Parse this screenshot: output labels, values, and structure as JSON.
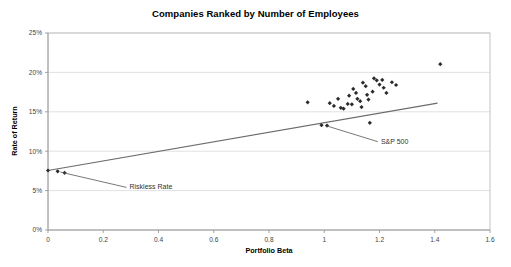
{
  "chart_data": {
    "type": "scatter",
    "title": "Companies Ranked by Number of Employees",
    "xlabel": "Portfolio Beta",
    "ylabel": "Rate of Return",
    "xlim": [
      0,
      1.6
    ],
    "ylim": [
      0,
      0.25
    ],
    "xticks": [
      0,
      0.2,
      0.4,
      0.6,
      0.8,
      1,
      1.2,
      1.4,
      1.6
    ],
    "xticklabels": [
      "0",
      "0.2",
      "0.4",
      "0.6",
      "0.8",
      "1",
      "1.2",
      "1.4",
      "1.6"
    ],
    "yticks": [
      0,
      0.05,
      0.1,
      0.15,
      0.2,
      0.25
    ],
    "yticklabels": [
      "0%",
      "5%",
      "10%",
      "15%",
      "20%",
      "25%"
    ],
    "grid": "horizontal",
    "legend": "none",
    "marker": "diamond",
    "marker_color": "#2b2b2b",
    "points": [
      {
        "x": 0.0,
        "y": 0.0755
      },
      {
        "x": 0.035,
        "y": 0.0745
      },
      {
        "x": 0.06,
        "y": 0.0725
      },
      {
        "x": 0.94,
        "y": 0.162
      },
      {
        "x": 0.99,
        "y": 0.133
      },
      {
        "x": 1.01,
        "y": 0.1325
      },
      {
        "x": 1.02,
        "y": 0.161
      },
      {
        "x": 1.035,
        "y": 0.1575
      },
      {
        "x": 1.05,
        "y": 0.1665
      },
      {
        "x": 1.06,
        "y": 0.155
      },
      {
        "x": 1.07,
        "y": 0.154
      },
      {
        "x": 1.085,
        "y": 0.16
      },
      {
        "x": 1.09,
        "y": 0.1705
      },
      {
        "x": 1.1,
        "y": 0.1595
      },
      {
        "x": 1.105,
        "y": 0.179
      },
      {
        "x": 1.115,
        "y": 0.174
      },
      {
        "x": 1.12,
        "y": 0.1665
      },
      {
        "x": 1.13,
        "y": 0.1635
      },
      {
        "x": 1.135,
        "y": 0.156
      },
      {
        "x": 1.14,
        "y": 0.187
      },
      {
        "x": 1.15,
        "y": 0.1825
      },
      {
        "x": 1.155,
        "y": 0.1715
      },
      {
        "x": 1.16,
        "y": 0.1655
      },
      {
        "x": 1.165,
        "y": 0.136
      },
      {
        "x": 1.175,
        "y": 0.1755
      },
      {
        "x": 1.18,
        "y": 0.1925
      },
      {
        "x": 1.19,
        "y": 0.19
      },
      {
        "x": 1.2,
        "y": 0.1845
      },
      {
        "x": 1.21,
        "y": 0.1905
      },
      {
        "x": 1.215,
        "y": 0.1805
      },
      {
        "x": 1.225,
        "y": 0.174
      },
      {
        "x": 1.245,
        "y": 0.1875
      },
      {
        "x": 1.26,
        "y": 0.184
      },
      {
        "x": 1.42,
        "y": 0.2105
      }
    ],
    "trendline": {
      "x_start": 0.0,
      "y_start": 0.0755,
      "x_end": 1.41,
      "y_end": 0.161
    },
    "annotations": [
      {
        "text": "Riskless Rate",
        "target_x": 0.045,
        "target_y": 0.0735,
        "label_x": 0.295,
        "label_y": 0.0515
      },
      {
        "text": "S&P 500",
        "target_x": 1.01,
        "target_y": 0.132,
        "label_x": 1.205,
        "label_y": 0.1095
      }
    ]
  }
}
